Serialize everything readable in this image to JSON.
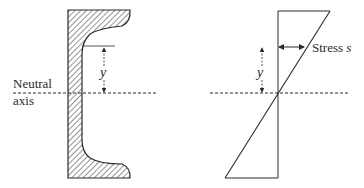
{
  "diagram": {
    "left_panel": {
      "shape": "channel-section",
      "labels": {
        "neutral_line1": "Neutral",
        "neutral_line2": "axis",
        "distance": "y"
      }
    },
    "right_panel": {
      "shape": "linear-stress-distribution",
      "labels": {
        "stress_word": "Stress",
        "stress_symbol": "s",
        "distance": "y"
      }
    },
    "colors": {
      "ink": "#2a2a2a",
      "background": "#ffffff"
    }
  }
}
